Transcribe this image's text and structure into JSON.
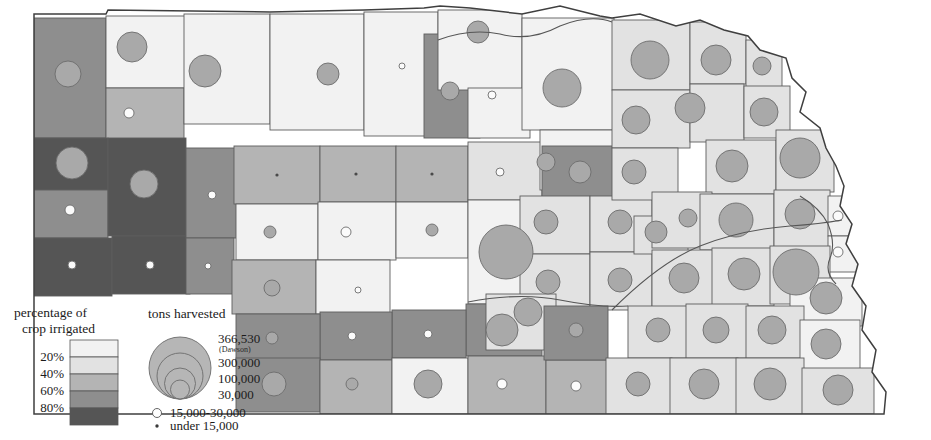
{
  "figure": {
    "kind": "thematic-map",
    "credit_text": ""
  },
  "legend_choropleth": {
    "title_line1": "percentage of",
    "title_line2": "crop irrigated",
    "name": "percentage-of-crop-irrigated-legend",
    "break_labels": [
      "20%",
      "40%",
      "60%",
      "80%"
    ],
    "swatches": [
      {
        "label": "0-20%",
        "color": "#f2f2f2"
      },
      {
        "label": "20-40%",
        "color": "#e2e2e2"
      },
      {
        "label": "40-60%",
        "color": "#b4b4b4"
      },
      {
        "label": "60-80%",
        "color": "#8e8e8e"
      },
      {
        "label": "80-100%",
        "color": "#555555"
      }
    ]
  },
  "legend_symbols": {
    "title": "tons harvested",
    "name": "tons-harvested-legend",
    "nested": [
      {
        "label": "366,530",
        "sublabel": "(Dawson)",
        "value": 366530
      },
      {
        "label": "300,000",
        "sublabel": "",
        "value": 300000
      },
      {
        "label": "100,000",
        "sublabel": "",
        "value": 100000
      },
      {
        "label": "30,000",
        "sublabel": "",
        "value": 30000
      }
    ],
    "small_classes": [
      {
        "symbol": "open-circle",
        "label": "15,000-30,000"
      },
      {
        "symbol": "dot",
        "label": "under 15,000"
      }
    ]
  },
  "chart_data": {
    "type": "map",
    "encoding": {
      "area_fill": "percentage of crop irrigated (5 classes)",
      "circle_area": "tons harvested (proportional circles)"
    },
    "class_breaks": [
      20,
      40,
      60,
      80
    ],
    "class_colors": [
      "#f2f2f2",
      "#e2e2e2",
      "#b4b4b4",
      "#8e8e8e",
      "#555555"
    ],
    "max_value_label": "366,530",
    "max_value_place": "Dawson",
    "symbol_breaks": [
      366530,
      300000,
      100000,
      30000,
      15000
    ],
    "counties": [
      {
        "x": 34,
        "y": 18,
        "w": 72,
        "h": 120,
        "cls": 3,
        "cx": 68,
        "cy": 74,
        "r": 13
      },
      {
        "x": 106,
        "y": 16,
        "w": 80,
        "h": 72,
        "cls": 0,
        "cx": 132,
        "cy": 47,
        "r": 15
      },
      {
        "x": 106,
        "y": 88,
        "w": 78,
        "h": 52,
        "cls": 2,
        "cx": 129,
        "cy": 113,
        "r": 5
      },
      {
        "x": 184,
        "y": 14,
        "w": 86,
        "h": 110,
        "cls": 0,
        "cx": 205,
        "cy": 71,
        "r": 16
      },
      {
        "x": 34,
        "y": 138,
        "w": 74,
        "h": 52,
        "cls": 4,
        "cx": 72,
        "cy": 163,
        "r": 16
      },
      {
        "x": 34,
        "y": 190,
        "w": 74,
        "h": 48,
        "cls": 3,
        "cx": 70,
        "cy": 210,
        "r": 5
      },
      {
        "x": 34,
        "y": 238,
        "w": 78,
        "h": 58,
        "cls": 4,
        "cx": 72,
        "cy": 265,
        "r": 4
      },
      {
        "x": 108,
        "y": 138,
        "w": 78,
        "h": 98,
        "cls": 4,
        "cx": 144,
        "cy": 184,
        "r": 14
      },
      {
        "x": 112,
        "y": 236,
        "w": 78,
        "h": 58,
        "cls": 4,
        "cx": 150,
        "cy": 265,
        "r": 4
      },
      {
        "x": 186,
        "y": 148,
        "w": 58,
        "h": 90,
        "cls": 3,
        "cx": 212,
        "cy": 195,
        "r": 4
      },
      {
        "x": 186,
        "y": 238,
        "w": 48,
        "h": 56,
        "cls": 3,
        "cx": 208,
        "cy": 266,
        "r": 3
      },
      {
        "x": 234,
        "y": 146,
        "w": 86,
        "h": 58,
        "cls": 2,
        "cx": 277,
        "cy": 175,
        "r": 2
      },
      {
        "x": 236,
        "y": 204,
        "w": 82,
        "h": 56,
        "cls": 0,
        "cx": 270,
        "cy": 232,
        "r": 6
      },
      {
        "x": 232,
        "y": 260,
        "w": 84,
        "h": 54,
        "cls": 2,
        "cx": 272,
        "cy": 288,
        "r": 8
      },
      {
        "x": 320,
        "y": 146,
        "w": 76,
        "h": 56,
        "cls": 2,
        "cx": 356,
        "cy": 174,
        "r": 2
      },
      {
        "x": 318,
        "y": 202,
        "w": 78,
        "h": 58,
        "cls": 0,
        "cx": 346,
        "cy": 232,
        "r": 5
      },
      {
        "x": 316,
        "y": 260,
        "w": 74,
        "h": 54,
        "cls": 0,
        "cx": 358,
        "cy": 290,
        "r": 3
      },
      {
        "x": 396,
        "y": 146,
        "w": 72,
        "h": 56,
        "cls": 2,
        "cx": 432,
        "cy": 174,
        "r": 2
      },
      {
        "x": 396,
        "y": 202,
        "w": 72,
        "h": 56,
        "cls": 0,
        "cx": 432,
        "cy": 230,
        "r": 6
      },
      {
        "x": 270,
        "y": 14,
        "w": 94,
        "h": 116,
        "cls": 0,
        "cx": 328,
        "cy": 74,
        "r": 11
      },
      {
        "x": 364,
        "y": 12,
        "w": 74,
        "h": 124,
        "cls": 0,
        "cx": 402,
        "cy": 66,
        "r": 3
      },
      {
        "x": 424,
        "y": 34,
        "w": 56,
        "h": 104,
        "cls": 3,
        "cx": 450,
        "cy": 91,
        "r": 9
      },
      {
        "x": 438,
        "y": 10,
        "w": 84,
        "h": 80,
        "cls": 0,
        "cx": 478,
        "cy": 32,
        "r": 11
      },
      {
        "x": 468,
        "y": 88,
        "w": 62,
        "h": 50,
        "cls": 0,
        "cx": 492,
        "cy": 95,
        "r": 4
      },
      {
        "x": 468,
        "y": 142,
        "w": 74,
        "h": 58,
        "cls": 1,
        "cx": 500,
        "cy": 172,
        "r": 4
      },
      {
        "x": 468,
        "y": 200,
        "w": 76,
        "h": 104,
        "cls": 0,
        "cx": 506,
        "cy": 252,
        "r": 27
      },
      {
        "x": 522,
        "y": 18,
        "w": 92,
        "h": 112,
        "cls": 0,
        "cx": 562,
        "cy": 88,
        "r": 19
      },
      {
        "x": 540,
        "y": 130,
        "w": 76,
        "h": 60,
        "cls": 0,
        "cx": 546,
        "cy": 162,
        "r": 9
      },
      {
        "x": 542,
        "y": 146,
        "w": 76,
        "h": 56,
        "cls": 3,
        "cx": 580,
        "cy": 172,
        "r": 11
      },
      {
        "x": 520,
        "y": 196,
        "w": 70,
        "h": 58,
        "cls": 1,
        "cx": 546,
        "cy": 222,
        "r": 12
      },
      {
        "x": 520,
        "y": 254,
        "w": 70,
        "h": 58,
        "cls": 1,
        "cx": 548,
        "cy": 282,
        "r": 12
      },
      {
        "x": 466,
        "y": 304,
        "w": 76,
        "h": 52,
        "cls": 3,
        "cx": 502,
        "cy": 330,
        "r": 16
      },
      {
        "x": 486,
        "y": 294,
        "w": 70,
        "h": 56,
        "cls": 1,
        "cx": 528,
        "cy": 312,
        "r": 14
      },
      {
        "x": 590,
        "y": 196,
        "w": 62,
        "h": 56,
        "cls": 1,
        "cx": 620,
        "cy": 222,
        "r": 12
      },
      {
        "x": 590,
        "y": 252,
        "w": 62,
        "h": 58,
        "cls": 1,
        "cx": 620,
        "cy": 280,
        "r": 12
      },
      {
        "x": 612,
        "y": 20,
        "w": 78,
        "h": 70,
        "cls": 1,
        "cx": 650,
        "cy": 60,
        "r": 19
      },
      {
        "x": 612,
        "y": 90,
        "w": 78,
        "h": 58,
        "cls": 1,
        "cx": 636,
        "cy": 120,
        "r": 14
      },
      {
        "x": 612,
        "y": 148,
        "w": 66,
        "h": 52,
        "cls": 1,
        "cx": 634,
        "cy": 172,
        "r": 12
      },
      {
        "x": 690,
        "y": 22,
        "w": 56,
        "h": 62,
        "cls": 1,
        "cx": 716,
        "cy": 60,
        "r": 15
      },
      {
        "x": 690,
        "y": 84,
        "w": 54,
        "h": 58,
        "cls": 1,
        "cx": 690,
        "cy": 108,
        "r": 15
      },
      {
        "x": 746,
        "y": 40,
        "w": 36,
        "h": 48,
        "cls": 1,
        "cx": 762,
        "cy": 66,
        "r": 9
      },
      {
        "x": 706,
        "y": 140,
        "w": 70,
        "h": 54,
        "cls": 1,
        "cx": 732,
        "cy": 166,
        "r": 16
      },
      {
        "x": 744,
        "y": 86,
        "w": 46,
        "h": 52,
        "cls": 1,
        "cx": 764,
        "cy": 112,
        "r": 14
      },
      {
        "x": 776,
        "y": 130,
        "w": 58,
        "h": 62,
        "cls": 1,
        "cx": 800,
        "cy": 158,
        "r": 20
      },
      {
        "x": 634,
        "y": 216,
        "w": 54,
        "h": 38,
        "cls": 1,
        "cx": 656,
        "cy": 232,
        "r": 11
      },
      {
        "x": 652,
        "y": 192,
        "w": 60,
        "h": 56,
        "cls": 1,
        "cx": 688,
        "cy": 218,
        "r": 9
      },
      {
        "x": 700,
        "y": 194,
        "w": 74,
        "h": 56,
        "cls": 1,
        "cx": 736,
        "cy": 220,
        "r": 17
      },
      {
        "x": 774,
        "y": 190,
        "w": 56,
        "h": 58,
        "cls": 1,
        "cx": 800,
        "cy": 214,
        "r": 15
      },
      {
        "x": 828,
        "y": 196,
        "w": 52,
        "h": 40,
        "cls": 0,
        "cx": 838,
        "cy": 216,
        "r": 5
      },
      {
        "x": 828,
        "y": 236,
        "w": 44,
        "h": 36,
        "cls": 0,
        "cx": 838,
        "cy": 252,
        "r": 5
      },
      {
        "x": 652,
        "y": 250,
        "w": 62,
        "h": 58,
        "cls": 1,
        "cx": 684,
        "cy": 278,
        "r": 15
      },
      {
        "x": 712,
        "y": 248,
        "w": 62,
        "h": 58,
        "cls": 1,
        "cx": 744,
        "cy": 274,
        "r": 16
      },
      {
        "x": 770,
        "y": 246,
        "w": 60,
        "h": 58,
        "cls": 1,
        "cx": 796,
        "cy": 272,
        "r": 23
      },
      {
        "x": 790,
        "y": 278,
        "w": 72,
        "h": 48,
        "cls": 0,
        "cx": 826,
        "cy": 298,
        "r": 16
      },
      {
        "x": 628,
        "y": 306,
        "w": 62,
        "h": 52,
        "cls": 1,
        "cx": 658,
        "cy": 330,
        "r": 12
      },
      {
        "x": 686,
        "y": 304,
        "w": 62,
        "h": 54,
        "cls": 1,
        "cx": 716,
        "cy": 330,
        "r": 13
      },
      {
        "x": 746,
        "y": 306,
        "w": 58,
        "h": 52,
        "cls": 1,
        "cx": 772,
        "cy": 330,
        "r": 14
      },
      {
        "x": 800,
        "y": 320,
        "w": 60,
        "h": 50,
        "cls": 0,
        "cx": 826,
        "cy": 344,
        "r": 15
      },
      {
        "x": 392,
        "y": 310,
        "w": 74,
        "h": 48,
        "cls": 3,
        "cx": 428,
        "cy": 334,
        "r": 4
      },
      {
        "x": 320,
        "y": 312,
        "w": 72,
        "h": 48,
        "cls": 3,
        "cx": 352,
        "cy": 336,
        "r": 4
      },
      {
        "x": 236,
        "y": 314,
        "w": 84,
        "h": 48,
        "cls": 3,
        "cx": 272,
        "cy": 338,
        "r": 6
      },
      {
        "x": 236,
        "y": 358,
        "w": 84,
        "h": 54,
        "cls": 3,
        "cx": 274,
        "cy": 384,
        "r": 12
      },
      {
        "x": 320,
        "y": 360,
        "w": 72,
        "h": 54,
        "cls": 2,
        "cx": 352,
        "cy": 384,
        "r": 6
      },
      {
        "x": 392,
        "y": 358,
        "w": 76,
        "h": 56,
        "cls": 0,
        "cx": 428,
        "cy": 384,
        "r": 14
      },
      {
        "x": 468,
        "y": 356,
        "w": 78,
        "h": 58,
        "cls": 2,
        "cx": 502,
        "cy": 384,
        "r": 5
      },
      {
        "x": 546,
        "y": 360,
        "w": 62,
        "h": 54,
        "cls": 2,
        "cx": 576,
        "cy": 386,
        "r": 5
      },
      {
        "x": 544,
        "y": 306,
        "w": 64,
        "h": 54,
        "cls": 3,
        "cx": 576,
        "cy": 330,
        "r": 7
      },
      {
        "x": 606,
        "y": 358,
        "w": 66,
        "h": 56,
        "cls": 1,
        "cx": 638,
        "cy": 384,
        "r": 12
      },
      {
        "x": 670,
        "y": 358,
        "w": 68,
        "h": 56,
        "cls": 1,
        "cx": 704,
        "cy": 384,
        "r": 15
      },
      {
        "x": 736,
        "y": 358,
        "w": 68,
        "h": 56,
        "cls": 1,
        "cx": 770,
        "cy": 384,
        "r": 16
      },
      {
        "x": 802,
        "y": 368,
        "w": 72,
        "h": 46,
        "cls": 1,
        "cx": 838,
        "cy": 390,
        "r": 15
      }
    ]
  }
}
